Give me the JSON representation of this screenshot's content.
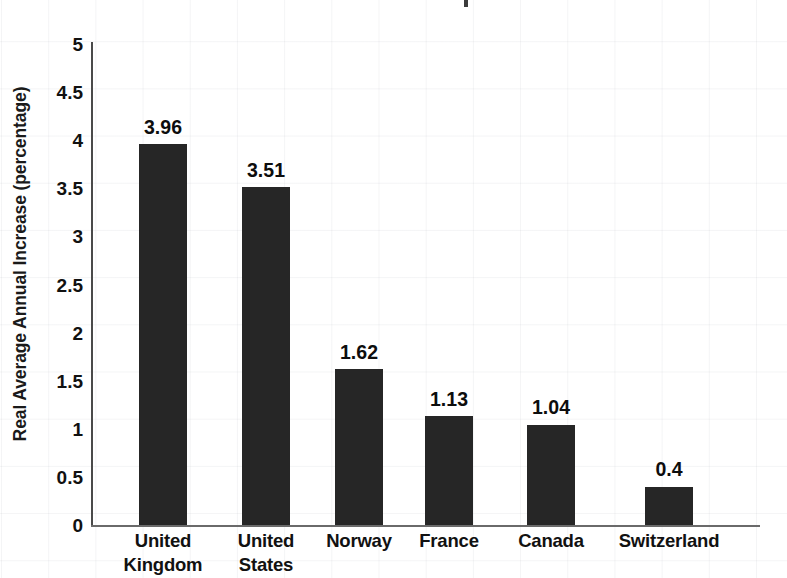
{
  "chart_data": {
    "type": "bar",
    "title": "",
    "xlabel": "",
    "ylabel": "Real Average Annual Increase (percentage)",
    "categories": [
      "United Kingdom",
      "United States",
      "Norway",
      "France",
      "Canada",
      "Switzerland"
    ],
    "values": [
      3.96,
      3.51,
      1.62,
      1.13,
      1.04,
      0.4
    ],
    "value_labels": [
      "3.96",
      "3.51",
      "1.62",
      "1.13",
      "1.04",
      "0.4"
    ],
    "ylim": [
      0,
      5
    ],
    "ytick_labels": [
      "5",
      "4.5",
      "4",
      "3.5",
      "3",
      "2.5",
      "2",
      "1.5",
      "1",
      "0.5",
      "0"
    ],
    "ytick_values": [
      5,
      4.5,
      4,
      3.5,
      3,
      2.5,
      2,
      1.5,
      1,
      0.5,
      0
    ],
    "grid": false,
    "legend": "none",
    "bar_color": "#262626",
    "axis_color": "#4a4a4a",
    "text_color": "#111111",
    "background_color": "#ffffff"
  }
}
